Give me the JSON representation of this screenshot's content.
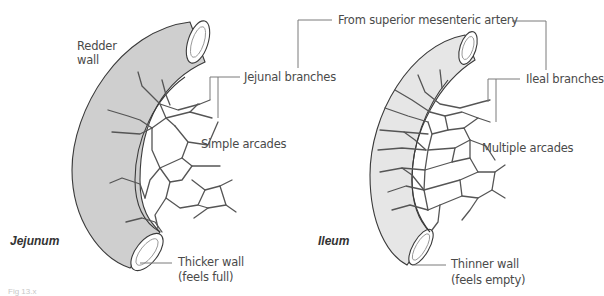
{
  "figure": {
    "caption": "Fig 13.x",
    "shared_label": "From superior mesenteric artery",
    "colors": {
      "jejunum_wall": "#cfcfcf",
      "ileum_wall": "#e6e6e6",
      "vessel": "#555555",
      "leader": "#7a7a7a",
      "text": "#4a4a4a"
    }
  },
  "jejunum": {
    "title": "Jejunum",
    "labels": {
      "wall_color_line1": "Redder",
      "wall_color_line2": "wall",
      "branches": "Jejunal branches",
      "arcades": "Simple arcades",
      "wall_thickness_line1": "Thicker wall",
      "wall_thickness_line2": "(feels full)"
    }
  },
  "ileum": {
    "title": "Ileum",
    "labels": {
      "branches": "Ileal branches",
      "arcades": "Multiple arcades",
      "wall_thickness_line1": "Thinner wall",
      "wall_thickness_line2": "(feels empty)"
    }
  }
}
